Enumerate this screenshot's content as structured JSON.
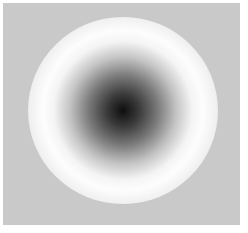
{
  "image": {
    "description": "Radially shaded sphere/disc with dark center, bright white ring, and gray rim on a light gray background",
    "colors": {
      "page_background": "#ffffff",
      "frame_background": "#c9c9c9",
      "center": "#0e0e0e",
      "ring_highlight": "#fdfdfd",
      "rim": "#8a8a8a"
    }
  }
}
